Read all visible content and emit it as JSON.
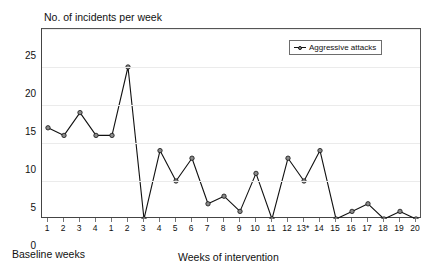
{
  "chart_data": {
    "type": "line",
    "title": "No. of incidents per week",
    "xlabel": "Weeks of intervention",
    "ylabel": "",
    "ylim": [
      0,
      25
    ],
    "yticks": [
      0,
      5,
      10,
      15,
      20,
      25
    ],
    "grid": true,
    "legend_position": "top-right",
    "legend_entries": [
      "Aggressive attacks"
    ],
    "phases": [
      {
        "name": "Baseline weeks",
        "caption": "Baseline weeks"
      },
      {
        "name": "Weeks of intervention",
        "caption": "Weeks of intervention"
      }
    ],
    "categories": [
      "1",
      "2",
      "3",
      "4",
      "1",
      "2",
      "3",
      "4",
      "5",
      "6",
      "7",
      "8",
      "9",
      "10",
      "11",
      "12",
      "13*",
      "14",
      "15",
      "16",
      "17",
      "18",
      "19",
      "20"
    ],
    "series": [
      {
        "name": "Aggressive attacks",
        "values": [
          12,
          11,
          14,
          11,
          11,
          20,
          0,
          9,
          5,
          8,
          2,
          3,
          1,
          6,
          0,
          8,
          5,
          9,
          0,
          1,
          2,
          0,
          1,
          0
        ]
      }
    ],
    "baseline_count": 4,
    "intervention_count": 20,
    "annotations": [
      "13* denotes an asterisked week"
    ]
  },
  "chart": {
    "title": "No. of incidents per week",
    "legend": {
      "label": "Aggressive attacks"
    },
    "captions": {
      "baseline": "Baseline weeks",
      "intervention": "Weeks of intervention"
    },
    "colors": {
      "line": "#111111",
      "marker_fill": "#8a8a8a",
      "marker_edge": "#111111",
      "grid": "#ebebeb",
      "axis": "#444444",
      "background": "#ffffff"
    }
  }
}
